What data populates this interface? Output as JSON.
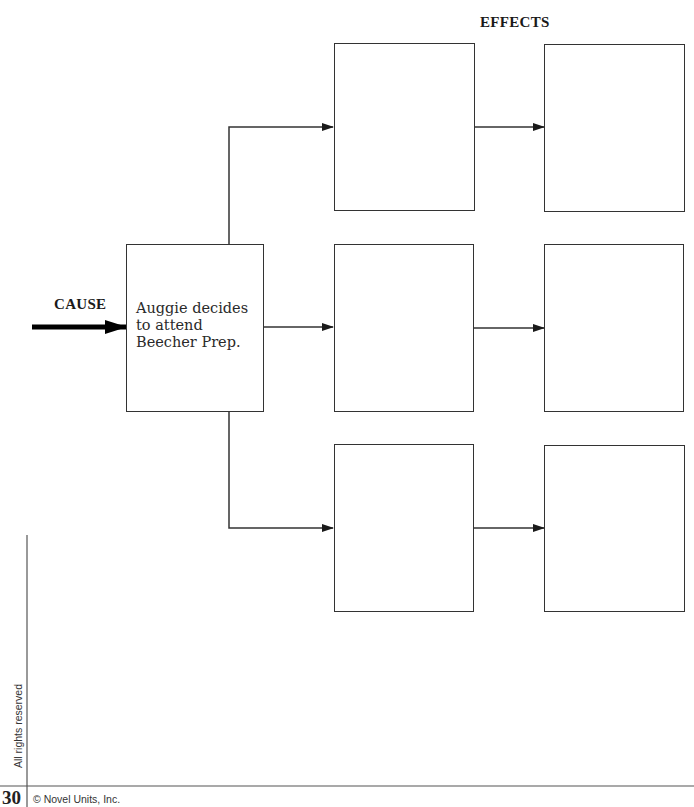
{
  "diagram": {
    "effects_label": "EFFECTS",
    "cause_label": "CAUSE",
    "cause_text": "Auggie decides to attend Beecher Prep.",
    "effect_boxes": [
      {
        "row": 1,
        "col": 1,
        "text": ""
      },
      {
        "row": 1,
        "col": 2,
        "text": ""
      },
      {
        "row": 2,
        "col": 1,
        "text": ""
      },
      {
        "row": 2,
        "col": 2,
        "text": ""
      },
      {
        "row": 3,
        "col": 1,
        "text": ""
      },
      {
        "row": 3,
        "col": 2,
        "text": ""
      }
    ]
  },
  "footer": {
    "page_number": "30",
    "copyright": "© Novel Units, Inc.",
    "side_note": "All rights reserved"
  }
}
